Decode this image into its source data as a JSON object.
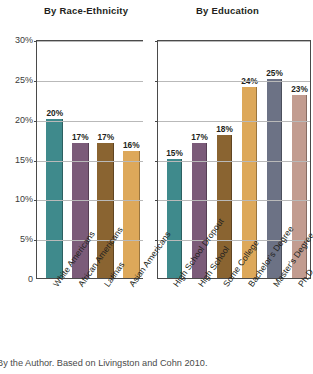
{
  "caption": "By the Author. Based on Livingston and Cohn 2010.",
  "axis": {
    "ticks": [
      "30%",
      "25%",
      "20%",
      "15%",
      "10%",
      "5%",
      "0"
    ],
    "tick_values": [
      30,
      25,
      20,
      15,
      10,
      5,
      0
    ],
    "ylim": [
      0,
      30
    ]
  },
  "panels": {
    "race": {
      "title": "By Race-Ethnicity"
    },
    "education": {
      "title": "By Education"
    }
  },
  "colors": {
    "teal": "#3f8a8c",
    "purple": "#7b5b79",
    "brown": "#8a6431",
    "tan": "#d9a busy",
    "orange": "#d9a busy2",
    "slate": "#6c7285",
    "rose": "#c29c90"
  },
  "chart_data": [
    {
      "type": "bar",
      "title": "By Race-Ethnicity",
      "xlabel": "",
      "ylabel": "",
      "ylim": [
        0,
        30
      ],
      "yticks": [
        0,
        5,
        10,
        15,
        20,
        25,
        30
      ],
      "ytick_labels": [
        "0",
        "5%",
        "10%",
        "15%",
        "20%",
        "25%",
        "30%"
      ],
      "grid": true,
      "legend": "none",
      "categories": [
        "White Americans",
        "African Americans",
        "Latinas",
        "Asian Americans"
      ],
      "values": [
        20,
        17,
        17,
        16
      ],
      "data_labels": [
        "20%",
        "17%",
        "17%",
        "16%"
      ],
      "bar_colors": [
        "#3f8a8c",
        "#7b5b79",
        "#8a6431",
        "#dda css"
      ]
    },
    {
      "type": "bar",
      "title": "By Education",
      "xlabel": "",
      "ylabel": "",
      "ylim": [
        0,
        30
      ],
      "yticks": [
        0,
        5,
        10,
        15,
        20,
        25,
        30
      ],
      "ytick_labels": [
        "0",
        "5%",
        "10%",
        "15%",
        "20%",
        "25%",
        "30%"
      ],
      "grid": true,
      "legend": "none",
      "categories": [
        "High School Dropout",
        "High School",
        "Some College",
        "Bachelor's Degree",
        "Master's Degree",
        "Ph.D."
      ],
      "values": [
        15,
        17,
        18,
        24,
        25,
        23
      ],
      "data_labels": [
        "15%",
        "17%",
        "18%",
        "24%",
        "25%",
        "23%"
      ],
      "bar_colors": [
        "#3f8a8c",
        "#7b5b79",
        "#8a6431",
        "#dda css",
        "#6c7285",
        "#c29c90"
      ]
    }
  ]
}
